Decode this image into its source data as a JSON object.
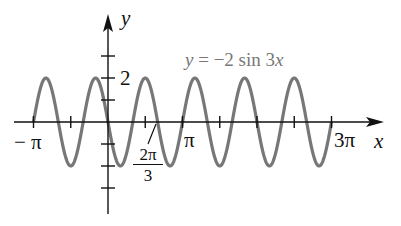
{
  "chart_data": {
    "type": "line",
    "title": "y = −2 sin 3x",
    "xlabel": "x",
    "ylabel": "y",
    "function": "y = -2 sin(3x)",
    "xlim_label": [
      "−π",
      "3π"
    ],
    "x_range_radians": [
      -3.14159,
      9.42478
    ],
    "ylim": [
      -2,
      2
    ],
    "x_tick_labels": [
      "−π",
      "2π/3",
      "π",
      "3π"
    ],
    "y_tick_labels": [
      "2"
    ],
    "x_ticks_step": "π/2",
    "y_ticks_step": 1,
    "amplitude": 2,
    "period": "2π/3",
    "curve_color": "#777777",
    "grid": false,
    "legend": null
  },
  "labels": {
    "y_axis": "y",
    "x_axis": "x",
    "equation": "y = −2 sin 3x",
    "tick_neg_pi": "− π",
    "tick_pi": "π",
    "tick_3pi": "3π",
    "tick_2pi3_num": "2π",
    "tick_2pi3_den": "3",
    "tick_y2": "2"
  }
}
